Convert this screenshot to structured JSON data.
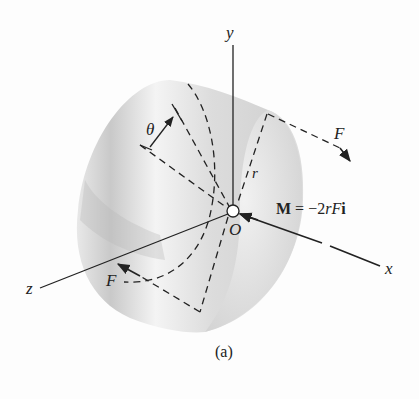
{
  "figure": {
    "caption": "(a)",
    "axes": {
      "x_label": "x",
      "y_label": "y",
      "z_label": "z",
      "origin_label": "O"
    },
    "labels": {
      "angle": "θ",
      "radius": "r",
      "force_top": "F",
      "force_bottom": "F",
      "moment_prefix": "M",
      "moment_equals": " = −2",
      "moment_r": "r",
      "moment_F": "F",
      "moment_unit": "i"
    },
    "colors": {
      "ink": "#222222",
      "cylinder_light": "#f2f2f2",
      "cylinder_mid": "#d6d6d6",
      "cylinder_dark": "#bdbdbd",
      "background": "#fdfdfd"
    }
  }
}
